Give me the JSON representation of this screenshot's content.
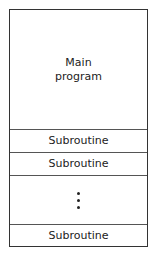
{
  "diagram": {
    "segments": [
      {
        "label_line1": "Main",
        "label_line2": "program"
      },
      {
        "label": "Subroutine"
      },
      {
        "label": "Subroutine"
      },
      {
        "label": "ellipsis"
      },
      {
        "label": "Subroutine"
      }
    ]
  }
}
